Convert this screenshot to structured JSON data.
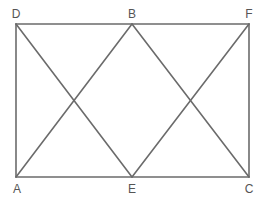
{
  "diagram": {
    "title": "",
    "points": [
      {
        "id": "D",
        "label": "D"
      },
      {
        "id": "B",
        "label": "B"
      },
      {
        "id": "F",
        "label": "F"
      },
      {
        "id": "A",
        "label": "A"
      },
      {
        "id": "E",
        "label": "E"
      },
      {
        "id": "C",
        "label": "C"
      }
    ],
    "segments": [
      [
        "D",
        "F"
      ],
      [
        "A",
        "C"
      ],
      [
        "D",
        "A"
      ],
      [
        "F",
        "C"
      ],
      [
        "D",
        "E"
      ],
      [
        "A",
        "B"
      ],
      [
        "B",
        "C"
      ],
      [
        "E",
        "F"
      ]
    ],
    "line_color": "#6b6b6b",
    "label_color": "#555555"
  }
}
